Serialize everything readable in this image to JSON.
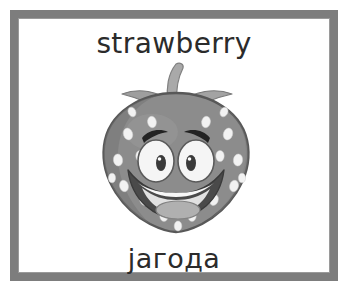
{
  "card": {
    "type": "vocabulary-flashcard",
    "background_color": "#ffffff",
    "frame_color": "#7d7d7d"
  },
  "word_top": {
    "text": "strawberry",
    "language": "English",
    "color": "#2b2b2b"
  },
  "word_bottom": {
    "text": "јагода",
    "language": "Serbian (Cyrillic)",
    "color": "#2b2b2b"
  },
  "illustration": {
    "name": "cartoon-strawberry",
    "description": "Smiling cartoon strawberry with eyes, eyebrows, open mouth and tongue",
    "colors": {
      "berry_body": "#8c8c8c",
      "berry_shadow": "#6f6f6f",
      "berry_outline": "#595959",
      "seed": "#f2f2f2",
      "stem": "#a9a9a9",
      "leaf": "#9e9e9e",
      "eye_white": "#f5f5f5",
      "pupil": "#3a3a3a",
      "eyebrow": "#232323",
      "mouth": "#4a4a4a",
      "teeth": "#f7f7f7",
      "tongue": "#b0b0b0"
    },
    "seed_count": 19
  }
}
